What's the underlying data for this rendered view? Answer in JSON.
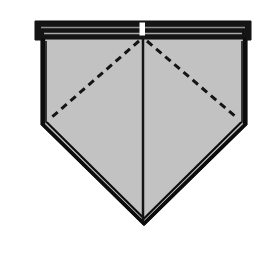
{
  "figure": {
    "title": "Folded pentagon napkin diagram",
    "canvas": {
      "width": 264,
      "height": 253,
      "background_color": "#ffffff"
    },
    "colors": {
      "body_fill": "#c2c2c2",
      "outline_stroke": "#0d0d0d",
      "band_fill": "#141414",
      "band_highlight": "#9a9a9a",
      "notch_fill": "#ffffff",
      "dashed_fold": "#141414",
      "center_fold": "#141414",
      "page_background": "#ffffff"
    },
    "parts": [
      {
        "name": "top-band",
        "label": "Folded top band",
        "kind": "filled-bar",
        "fill": "#141414",
        "note": "Thick dark horizontal band across the top edge with two thin lighter ruled lines suggesting stacked folded layers."
      },
      {
        "name": "band-highlight-line-upper",
        "label": "Upper fold highlight line",
        "kind": "line",
        "stroke": "#9a9a9a"
      },
      {
        "name": "band-highlight-line-lower",
        "label": "Lower fold highlight line",
        "kind": "line",
        "stroke": "#9a9a9a"
      },
      {
        "name": "center-notch",
        "label": "Center notch",
        "kind": "rect",
        "fill": "#ffffff",
        "note": "Small white rectangular gap at the top center where the two folded halves meet."
      },
      {
        "name": "body",
        "label": "Pentagon body",
        "kind": "polygon",
        "fill": "#c2c2c2",
        "stroke": "#0d0d0d"
      },
      {
        "name": "center-fold",
        "label": "Vertical center fold",
        "kind": "line",
        "stroke": "#141414",
        "style": "solid"
      },
      {
        "name": "dashed-fold-left",
        "label": "Left diagonal fold",
        "kind": "line",
        "stroke": "#141414",
        "style": "dashed"
      },
      {
        "name": "dashed-fold-right",
        "label": "Right diagonal fold",
        "kind": "line",
        "stroke": "#141414",
        "style": "dashed"
      },
      {
        "name": "left-edge",
        "label": "Left vertical edge",
        "kind": "line",
        "stroke": "#0d0d0d"
      },
      {
        "name": "right-edge",
        "label": "Right vertical edge",
        "kind": "line",
        "stroke": "#0d0d0d"
      },
      {
        "name": "lower-left-edge",
        "label": "Lower left diagonal edge",
        "kind": "line",
        "stroke": "#0d0d0d"
      },
      {
        "name": "lower-right-edge",
        "label": "Lower right diagonal edge",
        "kind": "line",
        "stroke": "#0d0d0d"
      },
      {
        "name": "bottom-point",
        "label": "Bottom point",
        "kind": "vertex"
      }
    ],
    "geometry": {
      "body_polygon_points": "42,38 246,38 246,124 144,224 42,124",
      "band_rect": {
        "x": 36,
        "y": 22,
        "width": 214,
        "height": 17
      },
      "band_highlight_upper": {
        "x1": 41,
        "y1": 27,
        "x2": 245,
        "y2": 27
      },
      "band_highlight_lower": {
        "x1": 43,
        "y1": 33,
        "x2": 243,
        "y2": 33
      },
      "notch_rect": {
        "x": 139,
        "y": 23,
        "width": 6,
        "height": 13
      },
      "center_fold": {
        "x1": 143,
        "y1": 38,
        "x2": 143,
        "y2": 224
      },
      "dashed_fold_left": {
        "x1": 140,
        "y1": 40,
        "x2": 52,
        "y2": 117
      },
      "dashed_fold_right": {
        "x1": 147,
        "y1": 40,
        "x2": 236,
        "y2": 117
      },
      "dash_pattern": "7 5",
      "inner_outline_points": "46,40 242,40 242,122 144,219 46,122"
    },
    "stroke_widths": {
      "outer_outline": 3.2,
      "inner_outline": 1.4,
      "center_fold": 2.4,
      "dashed_fold": 3.0,
      "band_highlight": 1.3
    }
  }
}
